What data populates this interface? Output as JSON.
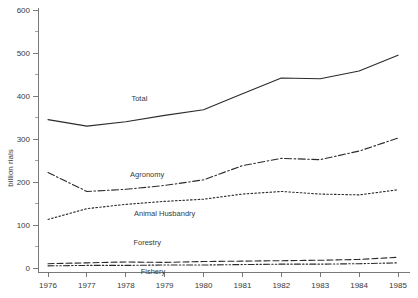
{
  "chart_data": {
    "type": "line",
    "title": "",
    "xlabel": "",
    "ylabel": "billion rials",
    "x": [
      1976,
      1977,
      1978,
      1979,
      1980,
      1981,
      1982,
      1983,
      1984,
      1985
    ],
    "categories": [
      "1976",
      "1977",
      "1978",
      "1979",
      "1980",
      "1981",
      "1982",
      "1983",
      "1984",
      "1985"
    ],
    "xlim": [
      1976,
      1985
    ],
    "ylim": [
      0,
      600
    ],
    "ytick_values": [
      0,
      100,
      200,
      300,
      400,
      500,
      600
    ],
    "ytick_labels": [
      "0",
      "100",
      "200",
      "300",
      "400",
      "500",
      "600"
    ],
    "yminor_tick_values": [
      50,
      150,
      250,
      350,
      450,
      550
    ],
    "grid": false,
    "legend": "inline-labels",
    "series": [
      {
        "name": "Total",
        "style": "solid",
        "values": [
          345,
          330,
          340,
          355,
          368,
          405,
          442,
          440,
          458,
          495
        ]
      },
      {
        "name": "Agronomy",
        "style": "dash-dot",
        "values": [
          222,
          178,
          183,
          192,
          205,
          238,
          255,
          252,
          272,
          302
        ]
      },
      {
        "name": "Animal Husbandry",
        "style": "dotted",
        "values": [
          113,
          138,
          148,
          155,
          160,
          172,
          178,
          172,
          170,
          182
        ]
      },
      {
        "name": "Forestry",
        "style": "dashed",
        "values": [
          10,
          12,
          14,
          13,
          15,
          16,
          17,
          18,
          20,
          25
        ]
      },
      {
        "name": "Fishery",
        "style": "dash-dot-dot",
        "values": [
          5,
          6,
          6,
          7,
          7,
          8,
          9,
          9,
          10,
          12
        ]
      }
    ],
    "annotations": [
      {
        "text": "Total",
        "x": 1978.35,
        "y": 388
      },
      {
        "text": "Agronomy",
        "x": 1978.55,
        "y": 212
      },
      {
        "text": "Animal Husbandry",
        "x": 1979.0,
        "y": 120
      },
      {
        "text": "Forestry",
        "x": 1978.55,
        "y": 53
      },
      {
        "text": "Fishery",
        "x": 1978.7,
        "y": -14
      }
    ],
    "colors": {
      "line": "#2b2b2b",
      "axis": "#6a6a6a",
      "text": "#3a3a3a",
      "background": "#ffffff"
    }
  }
}
